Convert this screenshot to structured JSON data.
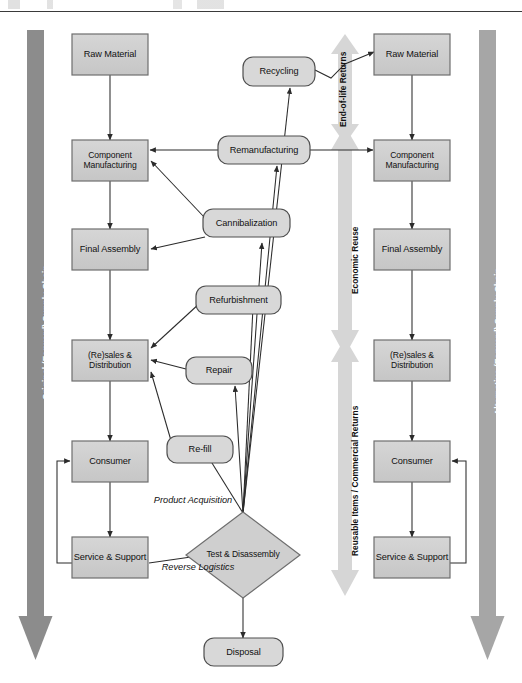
{
  "diagram": {
    "title_fragment_visible": "",
    "rails": {
      "left": {
        "label": "Original (Forward) Supply Chain",
        "color": "#8c8c8c"
      },
      "right": {
        "label": "Alternative (Forward) Supply Chain",
        "color": "#a8a8a8"
      }
    },
    "bands": [
      {
        "id": "band-end-of-life",
        "label": "End-of-life Returns",
        "color": "#d4d4d4"
      },
      {
        "id": "band-economic-reuse",
        "label": "Economic Reuse",
        "color": "#d4d4d4"
      },
      {
        "id": "band-reusable-items",
        "label": "Reusable Items / Commercial Returns",
        "color": "#d4d4d4"
      }
    ],
    "left_chain": [
      {
        "id": "left-raw-material",
        "label": "Raw Material"
      },
      {
        "id": "left-component-manufacturing",
        "label": "Component Manufacturing"
      },
      {
        "id": "left-final-assembly",
        "label": "Final Assembly"
      },
      {
        "id": "left-resales-distribution",
        "label": "(Re)sales & Distribution"
      },
      {
        "id": "left-consumer",
        "label": "Consumer"
      },
      {
        "id": "left-service-support",
        "label": "Service & Support"
      }
    ],
    "right_chain": [
      {
        "id": "right-raw-material",
        "label": "Raw Material"
      },
      {
        "id": "right-component-manufacturing",
        "label": "Component Manufacturing"
      },
      {
        "id": "right-final-assembly",
        "label": "Final Assembly"
      },
      {
        "id": "right-resales-distribution",
        "label": "(Re)sales & Distribution"
      },
      {
        "id": "right-consumer",
        "label": "Consumer"
      },
      {
        "id": "right-service-support",
        "label": "Service & Support"
      }
    ],
    "recovery_nodes": [
      {
        "id": "recycling",
        "label": "Recycling"
      },
      {
        "id": "remanufacturing",
        "label": "Remanufacturing"
      },
      {
        "id": "cannibalization",
        "label": "Cannibalization"
      },
      {
        "id": "refurbishment",
        "label": "Refurbishment"
      },
      {
        "id": "repair",
        "label": "Repair"
      },
      {
        "id": "re-fill",
        "label": "Re-fill"
      }
    ],
    "decision_node": {
      "id": "test-disassembly",
      "label": "Test & Disassembly"
    },
    "terminal_node": {
      "id": "disposal",
      "label": "Disposal"
    },
    "annotations": [
      {
        "id": "product-acquisition",
        "label": "Product Acquisition"
      },
      {
        "id": "reverse-logistics",
        "label": "Reverse Logistics"
      }
    ],
    "colors": {
      "box_fill": "#cfcfcf",
      "box_stroke": "#6e6e6e",
      "rounded_fill": "#d6d6d6",
      "rounded_stroke": "#555555",
      "diamond_fill": "#cfcfcf",
      "line": "#2b2b2b",
      "rail_left": "#8c8c8c",
      "rail_right": "#a8a8a8",
      "band": "#d4d4d4",
      "background": "#ffffff"
    }
  }
}
